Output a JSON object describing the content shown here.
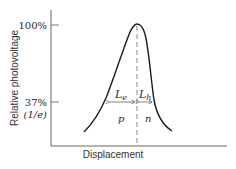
{
  "figure": {
    "ylabel": "Relative photovoltage",
    "xlabel": "Displacement",
    "yticks": [
      {
        "label": "100%",
        "y": 25
      },
      {
        "label": "37%",
        "y": 102
      },
      {
        "label": "(1/e)",
        "y": 102
      }
    ],
    "tick_100": "100%",
    "tick_37": "37%",
    "tick_1e": "(1/e)",
    "width_labels": {
      "left_main": "L",
      "left_sub": "e",
      "right_main": "L",
      "right_sub": "h"
    },
    "region_labels": {
      "left": "p",
      "right": "n"
    },
    "colors": {
      "curve": "#1a1a1a",
      "axis": "#555555",
      "dashed": "#888888"
    }
  }
}
